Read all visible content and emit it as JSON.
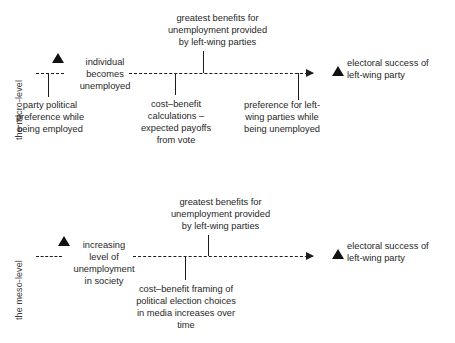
{
  "diagram": {
    "type": "two-row-causal-flow-diagram",
    "ink_color": "#1c1c1c",
    "background": "#ffffff"
  },
  "rows": [
    {
      "id": "micro",
      "axis_label": "the micro-level",
      "start_marker": "solid-up-triangle",
      "start_node": "individual\nbecomes\nunemployed",
      "end_marker": "solid-up-triangle",
      "end_node": "electoral success of\nleft-wing party",
      "above_annotations": [
        {
          "id": "micro-greatest-benefits",
          "text": "greatest benefits for\nunemployment provided\nby left-wing parties"
        }
      ],
      "below_annotations": [
        {
          "id": "micro-party-political",
          "text": "party political\npreference while\nbeing employed"
        },
        {
          "id": "micro-cost-benefit",
          "text": "cost–benefit\ncalculations –\nexpected payoffs\nfrom vote"
        },
        {
          "id": "micro-preference-left",
          "text": "preference for left-\nwing parties while\nbeing unemployed"
        }
      ]
    },
    {
      "id": "meso",
      "axis_label": "the meso-level",
      "start_marker": "solid-up-triangle",
      "start_node": "increasing\nlevel of\nunemployment\nin society",
      "end_marker": "solid-up-triangle",
      "end_node": "electoral success of\nleft-wing party",
      "above_annotations": [
        {
          "id": "meso-greatest-benefits",
          "text": "greatest benefits for\nunemployment provided\nby left-wing parties"
        }
      ],
      "below_annotations": [
        {
          "id": "meso-cost-benefit-framing",
          "text": "cost–benefit framing of\npolitical election choices\nin media increases over\ntime"
        }
      ]
    }
  ]
}
